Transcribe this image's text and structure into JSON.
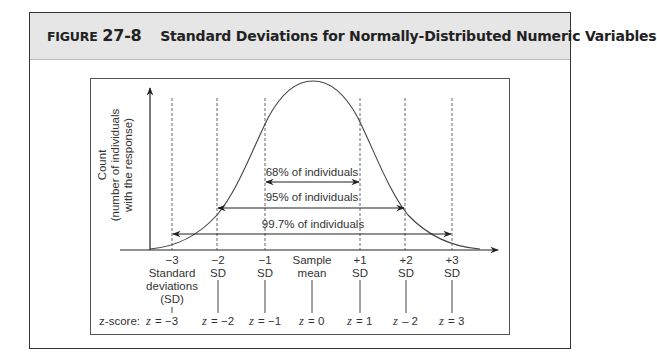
{
  "figure": {
    "label_word": "FIGURE",
    "label_number": "27-8",
    "title": "Standard Deviations for Normally-Distributed Numeric Variables"
  },
  "diagram": {
    "y_axis_label": [
      "Count",
      "(number of individuals",
      "with the response)"
    ],
    "ranges": [
      {
        "label": "68% of individuals",
        "from_sd": -1,
        "to_sd": 1
      },
      {
        "label": "95% of individuals",
        "from_sd": -2,
        "to_sd": 2
      },
      {
        "label": "99.7% of individuals",
        "from_sd": -3,
        "to_sd": 3
      }
    ],
    "ticks": [
      {
        "top": "−3",
        "lines": [
          "Standard",
          "deviations",
          "(SD)"
        ],
        "z": "= −3"
      },
      {
        "top": "−2",
        "lines": [
          "SD"
        ],
        "z": "= −2"
      },
      {
        "top": "−1",
        "lines": [
          "SD"
        ],
        "z": "= −1"
      },
      {
        "top": "Sample",
        "lines": [
          "mean"
        ],
        "z": "= 0"
      },
      {
        "top": "+1",
        "lines": [
          "SD"
        ],
        "z": "= 1"
      },
      {
        "top": "+2",
        "lines": [
          "SD"
        ],
        "z": "– 2"
      },
      {
        "top": "+3",
        "lines": [
          "SD"
        ],
        "z": "= 3"
      }
    ],
    "z_score_label": "z-score:",
    "z_var": "z"
  },
  "colors": {
    "header_bg": "#e6e6e6",
    "line": "#333333"
  }
}
